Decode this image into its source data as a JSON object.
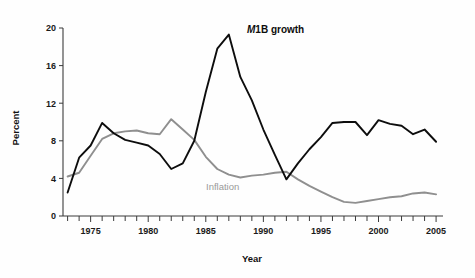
{
  "chart_data": {
    "type": "line",
    "title": "",
    "xlabel": "Year",
    "ylabel": "Percent",
    "xlim": [
      1972.6,
      2005.6
    ],
    "ylim": [
      0,
      20
    ],
    "yticks": [
      0,
      4,
      8,
      12,
      16,
      20
    ],
    "ytick_labels": [
      "0",
      "4",
      "8",
      "12",
      "16",
      "20"
    ],
    "xticks": [
      1973,
      1974,
      1975,
      1976,
      1977,
      1978,
      1979,
      1980,
      1981,
      1982,
      1983,
      1984,
      1985,
      1986,
      1987,
      1988,
      1989,
      1990,
      1991,
      1992,
      1993,
      1994,
      1995,
      1996,
      1997,
      1998,
      1999,
      2000,
      2001,
      2002,
      2003,
      2004,
      2005
    ],
    "xtick_labels": [
      "1975",
      "1980",
      "1985",
      "1990",
      "1995",
      "2000",
      "2005"
    ],
    "labeled_xticks": [
      1975,
      1980,
      1985,
      1990,
      1995,
      2000,
      2005
    ],
    "grid": false,
    "legend_position": "inline-annotations",
    "x": [
      1973,
      1974,
      1975,
      1976,
      1977,
      1978,
      1979,
      1980,
      1981,
      1982,
      1983,
      1984,
      1985,
      1986,
      1987,
      1988,
      1989,
      1990,
      1991,
      1992,
      1993,
      1994,
      1995,
      1996,
      1997,
      1998,
      1999,
      2000,
      2001,
      2002,
      2003,
      2004,
      2005
    ],
    "series": [
      {
        "name": "M1B growth",
        "color": "#0d0d0d",
        "values": [
          2.5,
          6.2,
          7.5,
          9.9,
          8.8,
          8.1,
          7.8,
          7.5,
          6.6,
          5.0,
          5.6,
          8.0,
          13.2,
          17.8,
          19.3,
          14.8,
          12.3,
          9.2,
          6.5,
          3.9,
          5.6,
          7.1,
          8.4,
          9.9,
          10.0,
          10.0,
          8.6,
          10.2,
          9.8,
          9.6,
          8.7,
          9.2,
          7.9
        ]
      },
      {
        "name": "Inflation",
        "color": "#8f8f8f",
        "values": [
          4.2,
          4.6,
          6.4,
          8.2,
          8.8,
          9.0,
          9.1,
          8.8,
          8.7,
          10.3,
          9.2,
          8.1,
          6.3,
          5.0,
          4.4,
          4.1,
          4.3,
          4.4,
          4.6,
          4.7,
          3.9,
          3.2,
          2.6,
          2.0,
          1.5,
          1.4,
          1.6,
          1.8,
          2.0,
          2.1,
          2.4,
          2.5,
          2.3
        ]
      }
    ],
    "annotations": [
      {
        "text_prefix": "M",
        "text_rest": "1B growth",
        "series": "M1B growth",
        "x": 1987.6,
        "y": 19.4
      },
      {
        "text": "Inflation",
        "series": "Inflation",
        "x": 1986.2,
        "y": 3.2
      }
    ]
  }
}
